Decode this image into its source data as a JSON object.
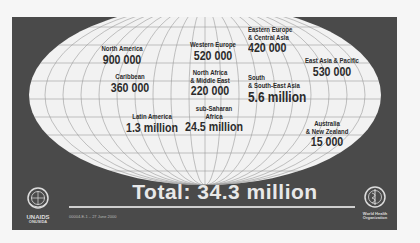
{
  "regions": [
    {
      "name": "North America",
      "value": "900 000"
    },
    {
      "name": "Caribbean",
      "value": "360 000"
    },
    {
      "name": "Latin America",
      "value": "1.3 million"
    },
    {
      "name": "Western Europe",
      "value": "520 000"
    },
    {
      "name": "North Africa\n& Middle East",
      "name_line1": "North Africa",
      "name_line2": "& Middle East",
      "value": "220 000"
    },
    {
      "name": "sub-Saharan\nAfrica",
      "name_line1": "sub-Saharan",
      "name_line2": "Africa",
      "value": "24.5 million"
    },
    {
      "name": "Eastern Europe\n& Central Asia",
      "name_line1": "Eastern Europe",
      "name_line2": "& Central Asia",
      "value": "420 000"
    },
    {
      "name": "South\n& South-East Asia",
      "name_line1": "South",
      "name_line2": "& South-East Asia",
      "value": "5.6 million"
    },
    {
      "name": "East Asia & Pacific",
      "value": "530 000"
    },
    {
      "name": "Australia\n& New Zealand",
      "name_line1": "Australia",
      "name_line2": "& New Zealand",
      "value": "15 000"
    }
  ],
  "total": "Total: 34.3 million",
  "footnote": "00004-E-1 – 27 June 2000",
  "logos": {
    "left": {
      "icon": "un-emblem-icon",
      "text_line1": "UNAIDS",
      "text_line2": "ONUSIDA"
    },
    "right": {
      "icon": "who-emblem-icon",
      "text_line1": "World Health",
      "text_line2": "Organization"
    }
  },
  "colors": {
    "background": "#4a4a4a",
    "globe": "#f2f2f2",
    "grid": "#9a9a9a",
    "label_text": "#2b2b2b",
    "total_text": "#e8e8e8"
  }
}
